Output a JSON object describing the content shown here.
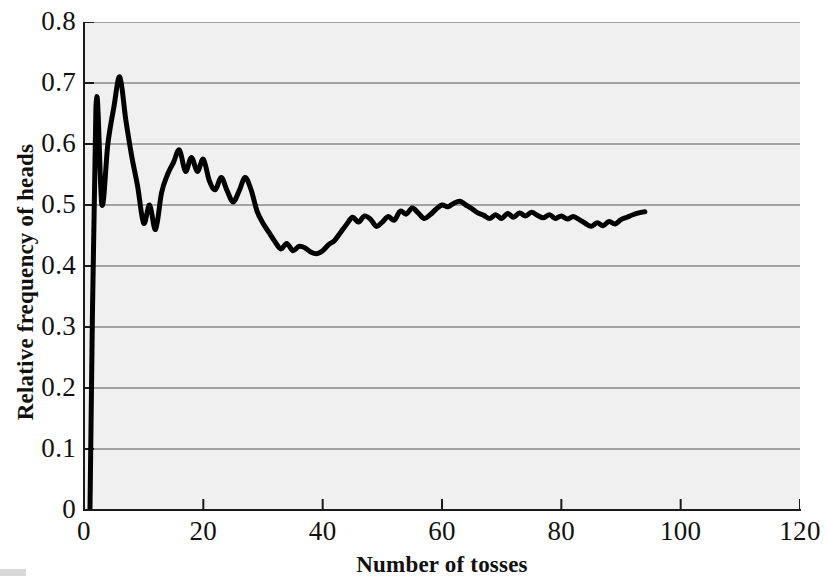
{
  "chart_data": {
    "type": "line",
    "title": "",
    "subtitle": "",
    "xlabel": "Number of tosses",
    "ylabel": "Relative frequency of heads",
    "xlim": [
      0,
      120
    ],
    "ylim": [
      0,
      0.8
    ],
    "xticks": [
      0,
      20,
      40,
      60,
      80,
      100,
      120
    ],
    "xtick_labels": [
      "0",
      "20",
      "40",
      "60",
      "80",
      "100",
      "120"
    ],
    "yticks": [
      0,
      0.1,
      0.2,
      0.3,
      0.4,
      0.5,
      0.6,
      0.7,
      0.8
    ],
    "ytick_labels": [
      "0",
      "0.1",
      "0.2",
      "0.3",
      "0.4",
      "0.5",
      "0.6",
      "0.7",
      "0.8"
    ],
    "grid": "horizontal",
    "grid_color": "#8a8a8a",
    "plot_background": "#f0f0f0",
    "line_color": "#000000",
    "line_width": 5,
    "legend": "none",
    "series": [
      {
        "name": "Relative frequency of heads",
        "x": [
          1,
          2,
          3,
          4,
          5,
          6,
          7,
          8,
          9,
          10,
          11,
          12,
          13,
          14,
          15,
          16,
          17,
          18,
          19,
          20,
          21,
          22,
          23,
          24,
          25,
          26,
          27,
          28,
          29,
          30,
          31,
          32,
          33,
          34,
          35,
          36,
          37,
          38,
          39,
          40,
          41,
          42,
          43,
          44,
          45,
          46,
          47,
          48,
          49,
          50,
          51,
          52,
          53,
          54,
          55,
          56,
          57,
          58,
          59,
          60,
          61,
          62,
          63,
          64,
          65,
          66,
          67,
          68,
          69,
          70,
          71,
          72,
          73,
          74,
          75,
          76,
          77,
          78,
          79,
          80,
          81,
          82,
          83,
          84,
          85,
          86,
          87,
          88,
          89,
          90,
          91,
          92,
          93,
          94
        ],
        "y": [
          0.0,
          0.66,
          0.5,
          0.6,
          0.66,
          0.71,
          0.64,
          0.58,
          0.53,
          0.47,
          0.5,
          0.46,
          0.52,
          0.55,
          0.57,
          0.59,
          0.555,
          0.578,
          0.555,
          0.575,
          0.54,
          0.525,
          0.545,
          0.523,
          0.505,
          0.523,
          0.545,
          0.525,
          0.49,
          0.47,
          0.455,
          0.44,
          0.428,
          0.437,
          0.425,
          0.432,
          0.43,
          0.423,
          0.42,
          0.425,
          0.435,
          0.442,
          0.455,
          0.468,
          0.48,
          0.472,
          0.482,
          0.477,
          0.465,
          0.472,
          0.481,
          0.475,
          0.49,
          0.485,
          0.495,
          0.487,
          0.478,
          0.484,
          0.493,
          0.5,
          0.497,
          0.503,
          0.506,
          0.5,
          0.494,
          0.487,
          0.483,
          0.478,
          0.484,
          0.478,
          0.486,
          0.48,
          0.487,
          0.482,
          0.488,
          0.483,
          0.479,
          0.484,
          0.478,
          0.482,
          0.477,
          0.481,
          0.476,
          0.47,
          0.465,
          0.471,
          0.466,
          0.473,
          0.469,
          0.476,
          0.48,
          0.484,
          0.487,
          0.489
        ]
      }
    ],
    "annotations": []
  },
  "axes": {
    "x_title": "Number of tosses",
    "y_title": "Relative frequency of heads",
    "x_labels": [
      "0",
      "20",
      "40",
      "60",
      "80",
      "100",
      "120"
    ],
    "y_labels": [
      "0.8",
      "0.7",
      "0.6",
      "0.5",
      "0.4",
      "0.3",
      "0.2",
      "0.1",
      "0"
    ]
  }
}
